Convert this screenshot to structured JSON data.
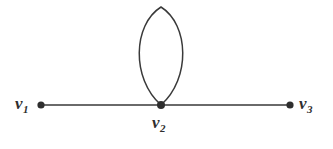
{
  "figure": {
    "kind": "undirected-graph-diagram",
    "background_color": "#ffffff",
    "stroke_color": "#3a3a3a",
    "label_color": "#2e2e2e",
    "width": 333,
    "height": 149
  },
  "vertices": [
    {
      "id": "v1",
      "label": "v",
      "subscript": "1",
      "x": 41,
      "y": 105,
      "radius": 3.6
    },
    {
      "id": "v2",
      "label": "v",
      "subscript": "2",
      "x": 161,
      "y": 105,
      "radius": 4.0
    },
    {
      "id": "v3",
      "label": "v",
      "subscript": "3",
      "x": 290,
      "y": 105,
      "radius": 3.6
    }
  ],
  "edges": [
    {
      "id": "e1",
      "from": "v1",
      "to": "v2",
      "shape": "straight-line"
    },
    {
      "id": "e2",
      "from": "v2",
      "to": "v3",
      "shape": "straight-line"
    },
    {
      "id": "e3",
      "from": "v2",
      "to": "v2",
      "shape": "self-loop-ellipse",
      "apex_y": 7,
      "half_width": 23,
      "widest_y": 50
    }
  ],
  "labels": {
    "v1_text": "v",
    "v1_sub": "1",
    "v2_text": "v",
    "v2_sub": "2",
    "v3_text": "v",
    "v3_sub": "3"
  }
}
